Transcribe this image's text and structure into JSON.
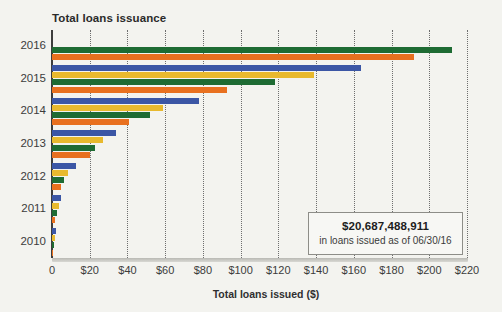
{
  "chart_data": {
    "type": "bar",
    "orientation": "horizontal",
    "title": "Total loans issuance",
    "subtitle": "",
    "xlabel": "Total loans issued ($)",
    "ylabel": "",
    "xlim": [
      0,
      220
    ],
    "ylim": null,
    "grid": true,
    "grid_axis": "x",
    "legend": false,
    "legend_position": "none",
    "categories": [
      "2016",
      "2015",
      "2014",
      "2013",
      "2012",
      "2011",
      "2010"
    ],
    "xticks": [
      0,
      20,
      40,
      60,
      80,
      100,
      120,
      140,
      160,
      180,
      200,
      220
    ],
    "xticklabels": [
      "0",
      "$20",
      "$40",
      "$60",
      "$80",
      "$100",
      "$120",
      "$140",
      "$160",
      "$180",
      "$200",
      "$220"
    ],
    "series": [
      {
        "name": "series-1",
        "color": "#3b56a5",
        "values": [
          null,
          164,
          78,
          34,
          12.5,
          5.0,
          2.0
        ]
      },
      {
        "name": "series-2",
        "color": "#e8b92e",
        "values": [
          null,
          139,
          59,
          27,
          8.5,
          3.5,
          1.5
        ]
      },
      {
        "name": "series-3",
        "color": "#1e6b33",
        "values": [
          212,
          118,
          52,
          23,
          6.5,
          2.5,
          1.0
        ]
      },
      {
        "name": "series-4",
        "color": "#e8701f",
        "values": [
          192,
          93,
          41,
          20,
          5.0,
          1.5,
          0.5
        ]
      }
    ],
    "annotation": {
      "value": "$20,687,488,911",
      "caption": "in loans issued as of 06/30/16"
    }
  },
  "colors": {
    "background": "#f3f3ef",
    "axis": "#3d3d3d",
    "gridline": "#6e6e6e",
    "text": "#3c3c3c",
    "callout_border": "#8d8d88"
  }
}
